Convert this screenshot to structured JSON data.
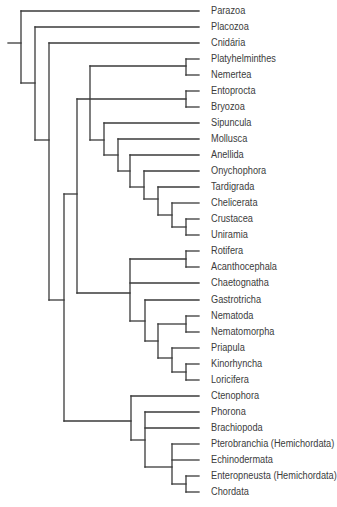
{
  "diagram": {
    "type": "cladogram",
    "line_color": "#3a3a3a",
    "text_color": "#3c3c3c",
    "leaf_line_end_x": 199,
    "leaves": [
      {
        "label": "Parazoa",
        "y": 11
      },
      {
        "label": "Placozoa",
        "y": 27
      },
      {
        "label": "Cnidária",
        "y": 43
      },
      {
        "label": "Platyhelminthes",
        "y": 59
      },
      {
        "label": "Nemertea",
        "y": 75
      },
      {
        "label": "Entoprocta",
        "y": 91
      },
      {
        "label": "Bryozoa",
        "y": 107
      },
      {
        "label": "Sipuncula",
        "y": 123
      },
      {
        "label": "Mollusca",
        "y": 139
      },
      {
        "label": "Anellida",
        "y": 155
      },
      {
        "label": "Onychophora",
        "y": 171
      },
      {
        "label": "Tardigrada",
        "y": 187
      },
      {
        "label": "Chelicerata",
        "y": 203
      },
      {
        "label": "Crustacea",
        "y": 219
      },
      {
        "label": "Uniramia",
        "y": 235
      },
      {
        "label": "Rotifera",
        "y": 251
      },
      {
        "label": "Acanthocephala",
        "y": 267
      },
      {
        "label": "Chaetognatha",
        "y": 283
      },
      {
        "label": "Gastrotricha",
        "y": 300
      },
      {
        "label": "Nematoda",
        "y": 316
      },
      {
        "label": "Nematomorpha",
        "y": 332
      },
      {
        "label": "Priapula",
        "y": 348
      },
      {
        "label": "Kinorhyncha",
        "y": 364
      },
      {
        "label": "Loricifera",
        "y": 380
      },
      {
        "label": "Ctenophora",
        "y": 396
      },
      {
        "label": "Phorona",
        "y": 412
      },
      {
        "label": "Brachiopoda",
        "y": 428
      },
      {
        "label": "Pterobranchia (Hemichordata)",
        "y": 444
      },
      {
        "label": "Echinodermata",
        "y": 460
      },
      {
        "label": "Enteropneusta (Hemichordata)",
        "y": 476
      },
      {
        "label": "Chordata",
        "y": 492
      }
    ],
    "segments": [
      [
        8,
        43,
        21,
        43
      ],
      [
        21,
        11,
        21,
        83
      ],
      [
        21,
        11,
        199,
        11
      ],
      [
        21,
        83,
        35,
        83
      ],
      [
        35,
        27,
        35,
        140
      ],
      [
        35,
        27,
        199,
        27
      ],
      [
        35,
        140,
        49,
        140
      ],
      [
        49,
        43,
        49,
        300
      ],
      [
        49,
        43,
        199,
        43
      ],
      [
        49,
        300,
        64,
        300
      ],
      [
        64,
        194,
        64,
        421
      ],
      [
        64,
        194,
        77,
        194
      ],
      [
        64,
        421,
        131,
        421
      ],
      [
        77,
        99,
        77,
        293
      ],
      [
        77,
        293,
        130,
        293
      ],
      [
        77,
        99,
        186,
        99
      ],
      [
        186,
        91,
        186,
        107
      ],
      [
        186,
        91,
        199,
        91
      ],
      [
        186,
        107,
        199,
        107
      ],
      [
        90,
        66,
        90,
        140
      ],
      [
        90,
        140,
        104,
        140
      ],
      [
        90,
        66,
        186,
        66
      ],
      [
        186,
        59,
        186,
        75
      ],
      [
        186,
        59,
        199,
        59
      ],
      [
        186,
        75,
        199,
        75
      ],
      [
        104,
        123,
        104,
        155
      ],
      [
        104,
        123,
        199,
        123
      ],
      [
        104,
        155,
        118,
        155
      ],
      [
        118,
        139,
        118,
        171
      ],
      [
        118,
        139,
        199,
        139
      ],
      [
        118,
        171,
        130,
        171
      ],
      [
        130,
        155,
        130,
        187
      ],
      [
        130,
        155,
        199,
        155
      ],
      [
        130,
        187,
        144,
        187
      ],
      [
        144,
        171,
        144,
        199
      ],
      [
        144,
        171,
        199,
        171
      ],
      [
        144,
        199,
        158,
        199
      ],
      [
        158,
        187,
        158,
        215
      ],
      [
        158,
        187,
        199,
        187
      ],
      [
        158,
        215,
        172,
        215
      ],
      [
        172,
        203,
        172,
        227
      ],
      [
        172,
        203,
        199,
        203
      ],
      [
        172,
        227,
        186,
        227
      ],
      [
        186,
        219,
        186,
        235
      ],
      [
        186,
        219,
        199,
        219
      ],
      [
        186,
        235,
        199,
        235
      ],
      [
        130,
        259,
        130,
        321
      ],
      [
        130,
        259,
        186,
        259
      ],
      [
        186,
        251,
        186,
        267
      ],
      [
        186,
        251,
        199,
        251
      ],
      [
        186,
        267,
        199,
        267
      ],
      [
        130,
        283,
        199,
        283
      ],
      [
        130,
        321,
        145,
        321
      ],
      [
        145,
        300,
        145,
        341
      ],
      [
        145,
        300,
        199,
        300
      ],
      [
        145,
        341,
        158,
        341
      ],
      [
        158,
        324,
        158,
        358
      ],
      [
        158,
        324,
        186,
        324
      ],
      [
        186,
        316,
        186,
        332
      ],
      [
        186,
        316,
        199,
        316
      ],
      [
        186,
        332,
        199,
        332
      ],
      [
        158,
        358,
        172,
        358
      ],
      [
        172,
        348,
        172,
        372
      ],
      [
        172,
        348,
        199,
        348
      ],
      [
        172,
        372,
        186,
        372
      ],
      [
        186,
        364,
        186,
        380
      ],
      [
        186,
        364,
        199,
        364
      ],
      [
        186,
        380,
        199,
        380
      ],
      [
        131,
        396,
        131,
        440
      ],
      [
        131,
        396,
        199,
        396
      ],
      [
        131,
        440,
        145,
        440
      ],
      [
        145,
        412,
        145,
        467
      ],
      [
        145,
        412,
        199,
        412
      ],
      [
        145,
        428,
        199,
        428
      ],
      [
        145,
        467,
        172,
        467
      ],
      [
        172,
        444,
        172,
        484
      ],
      [
        172,
        444,
        199,
        444
      ],
      [
        172,
        460,
        199,
        460
      ],
      [
        172,
        484,
        186,
        484
      ],
      [
        186,
        476,
        186,
        492
      ],
      [
        186,
        476,
        199,
        476
      ],
      [
        186,
        492,
        199,
        492
      ]
    ]
  }
}
